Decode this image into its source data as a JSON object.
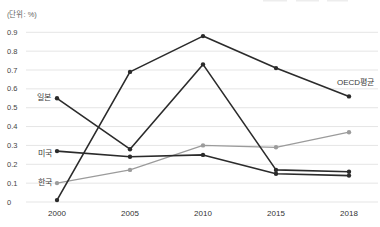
{
  "chart_data": {
    "type": "line",
    "title": "",
    "unit_label": "(단위: %)",
    "xlabel": "",
    "ylabel": "",
    "x_categories": [
      "2000",
      "2005",
      "2010",
      "2015",
      "2018"
    ],
    "y_ticks": [
      "0.9",
      "0.8",
      "0.7",
      "0.6",
      "0.5",
      "0.4",
      "0.3",
      "0.2",
      "0.1",
      "0"
    ],
    "ylim": [
      0,
      0.95
    ],
    "grid": true,
    "legend_position": "inline-labels",
    "series": [
      {
        "key": "korea",
        "name": "한국",
        "color": "#9b9b9b",
        "line_width": 1.2,
        "values": [
          0.1,
          0.17,
          0.3,
          0.29,
          0.37
        ]
      },
      {
        "key": "usa",
        "name": "미국",
        "color": "#2b2b2b",
        "line_width": 1.6,
        "values": [
          0.27,
          0.24,
          0.25,
          0.15,
          0.14
        ]
      },
      {
        "key": "japan",
        "name": "일본",
        "color": "#2b2b2b",
        "line_width": 1.6,
        "values": [
          0.55,
          0.28,
          0.73,
          0.17,
          0.16
        ]
      },
      {
        "key": "oecd-avg",
        "name": "OECD평균",
        "color": "#2b2b2b",
        "line_width": 1.6,
        "values": [
          0.01,
          0.69,
          0.88,
          0.71,
          0.56
        ]
      }
    ],
    "grid_color": "#e5e5e5",
    "tick_text_color": "#444444",
    "artifact_dash_color": "#ededed"
  }
}
